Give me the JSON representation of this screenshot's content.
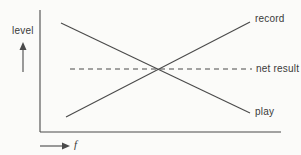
{
  "diagram": {
    "y_axis_label": "level",
    "x_axis_label": "f",
    "lines": [
      {
        "id": "record",
        "label": "record",
        "style": "solid",
        "x1": 66,
        "y1": 117,
        "x2": 250,
        "y2": 22
      },
      {
        "id": "play",
        "label": "play",
        "style": "solid",
        "x1": 61,
        "y1": 23,
        "x2": 250,
        "y2": 113
      },
      {
        "id": "net_result",
        "label": "net result",
        "style": "dashed",
        "x1": 70,
        "y1": 69,
        "x2": 252,
        "y2": 69
      }
    ],
    "colors": {
      "line": "#4a4a4a",
      "text": "#3a3a3a",
      "background": "#fbfbf9"
    }
  },
  "chart_data": {
    "type": "line",
    "title": "",
    "xlabel": "f",
    "ylabel": "level",
    "qualitative": true,
    "axis_ticks": "none",
    "grid": false,
    "legend_position": "right-inline",
    "x": [
      0,
      1
    ],
    "series": [
      {
        "name": "record",
        "style": "solid",
        "values": [
          0.12,
          0.95
        ]
      },
      {
        "name": "play",
        "style": "solid",
        "values": [
          0.94,
          0.15
        ]
      },
      {
        "name": "net result",
        "style": "dashed",
        "values": [
          0.55,
          0.55
        ]
      }
    ]
  }
}
